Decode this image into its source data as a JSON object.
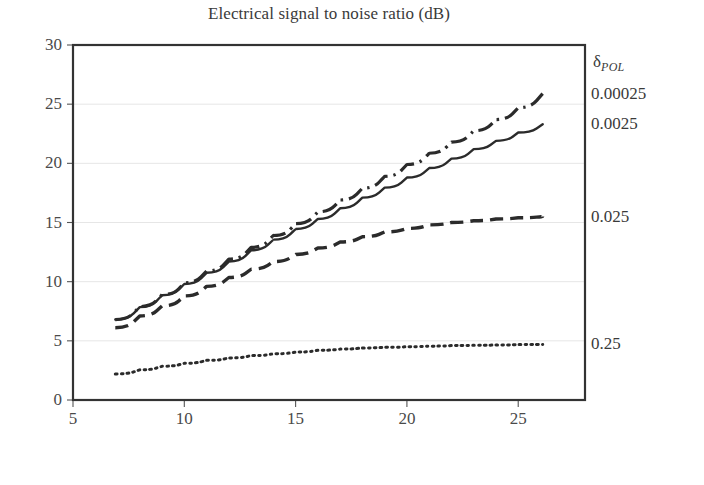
{
  "chart_data": {
    "type": "line",
    "title": "Electrical signal to noise ratio (dB)",
    "xlabel": "Ideal electrical signal to noise ratio (dB)",
    "ylabel": "",
    "xlim": [
      5,
      28
    ],
    "ylim": [
      0,
      30
    ],
    "xticks": [
      5,
      10,
      15,
      20,
      25
    ],
    "yticks": [
      0,
      5,
      10,
      15,
      20,
      25,
      30
    ],
    "grid": "horizontal",
    "legend_position": "right-outside",
    "legend_title": "δPOL",
    "legend_title_symbol": "δ",
    "legend_title_subscript": "POL",
    "series": [
      {
        "name": "0.00025",
        "label": "0.00025",
        "dash": "dash-dot",
        "color": "#2b2b2b",
        "x": [
          6.9,
          8.0,
          9.0,
          10.0,
          11.0,
          12.0,
          13.0,
          14.0,
          15.0,
          16.0,
          17.0,
          18.0,
          19.0,
          20.0,
          21.0,
          22.0,
          23.0,
          24.0,
          25.0,
          26.1
        ],
        "y": [
          6.8,
          7.9,
          8.9,
          9.9,
          10.9,
          11.9,
          12.9,
          13.9,
          14.9,
          15.9,
          16.9,
          17.9,
          18.9,
          19.9,
          20.85,
          21.8,
          22.75,
          23.7,
          24.7,
          25.9
        ]
      },
      {
        "name": "0.0025",
        "label": "0.0025",
        "dash": "solid",
        "color": "#2b2b2b",
        "x": [
          6.9,
          8.0,
          9.0,
          10.0,
          11.0,
          12.0,
          13.0,
          14.0,
          15.0,
          16.0,
          17.0,
          18.0,
          19.0,
          20.0,
          21.0,
          22.0,
          23.0,
          24.0,
          25.0,
          26.1
        ],
        "y": [
          6.8,
          7.85,
          8.85,
          9.8,
          10.75,
          11.7,
          12.65,
          13.55,
          14.45,
          15.3,
          16.2,
          17.1,
          17.95,
          18.8,
          19.6,
          20.4,
          21.2,
          21.9,
          22.6,
          23.3
        ]
      },
      {
        "name": "0.025",
        "label": "0.025",
        "dash": "dashed",
        "color": "#2b2b2b",
        "x": [
          6.9,
          8.0,
          9.0,
          10.0,
          11.0,
          12.0,
          13.0,
          14.0,
          15.0,
          16.0,
          17.0,
          18.0,
          19.0,
          20.0,
          21.0,
          22.0,
          23.0,
          24.0,
          25.0,
          26.1
        ],
        "y": [
          6.1,
          7.1,
          7.95,
          8.8,
          9.6,
          10.35,
          11.05,
          11.7,
          12.3,
          12.85,
          13.35,
          13.8,
          14.2,
          14.5,
          14.8,
          15.0,
          15.15,
          15.3,
          15.4,
          15.5
        ]
      },
      {
        "name": "0.25",
        "label": "0.25",
        "dash": "dotted",
        "color": "#2b2b2b",
        "x": [
          6.9,
          8.0,
          9.0,
          10.0,
          11.0,
          12.0,
          13.0,
          14.0,
          15.0,
          16.0,
          17.0,
          18.0,
          19.0,
          20.0,
          21.0,
          22.0,
          23.0,
          24.0,
          25.0,
          26.1
        ],
        "y": [
          2.2,
          2.55,
          2.85,
          3.1,
          3.35,
          3.55,
          3.75,
          3.9,
          4.05,
          4.2,
          4.3,
          4.4,
          4.45,
          4.5,
          4.55,
          4.6,
          4.62,
          4.65,
          4.68,
          4.7
        ]
      }
    ]
  },
  "axes": {
    "y_tick_labels": [
      "0",
      "5",
      "10",
      "15",
      "20",
      "25",
      "30"
    ],
    "x_tick_labels": [
      "5",
      "10",
      "15",
      "20",
      "25"
    ]
  },
  "colors": {
    "line": "#2b2b2b",
    "frame": "#333333",
    "grid": "#e6e6e6",
    "text": "#3a3a3a",
    "background": "#ffffff"
  }
}
